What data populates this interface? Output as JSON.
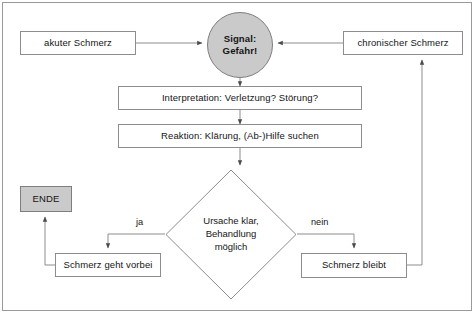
{
  "diagram": {
    "colors": {
      "shape_fill_grey": "#cacaca",
      "shape_fill_white": "#ffffff",
      "stroke": "#8d8d8d",
      "text": "#151515",
      "frame": "#9a9a9a"
    },
    "nodes": {
      "akuter_schmerz": {
        "label": "akuter Schmerz",
        "shape": "box"
      },
      "chronischer_schmerz": {
        "label": "chronischer Schmerz",
        "shape": "box"
      },
      "signal": {
        "label_line1": "Signal:",
        "label_line2": "Gefahr!",
        "shape": "circle"
      },
      "interpretation": {
        "label": "Interpretation: Verletzung? Störung?",
        "shape": "box"
      },
      "reaktion": {
        "label": "Reaktion: Klärung, (Ab-)Hilfe suchen",
        "shape": "box"
      },
      "entscheidung": {
        "label_line1": "Ursache klar,",
        "label_line2": "Behandlung",
        "label_line3": "möglich",
        "shape": "diamond"
      },
      "ende": {
        "label": "ENDE",
        "shape": "box"
      },
      "schmerz_geht_vorbei": {
        "label": "Schmerz geht vorbei",
        "shape": "box"
      },
      "schmerz_bleibt": {
        "label": "Schmerz bleibt",
        "shape": "box"
      }
    },
    "edge_labels": {
      "ja": "ja",
      "nein": "nein"
    }
  }
}
